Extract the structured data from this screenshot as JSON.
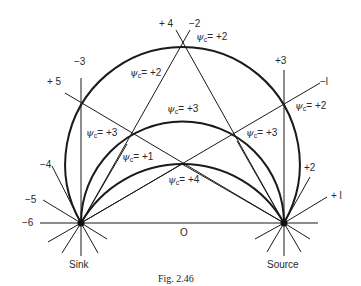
{
  "figure": {
    "caption": "Fig. 2.46",
    "sink_label": "Sink",
    "source_label": "Source",
    "axis_zero_label": "O"
  },
  "line_labels": {
    "minus6": "−6",
    "minus5": "−5",
    "minus4": "−4",
    "minus3": "−3",
    "plus5": "+ 5",
    "plus4": "+ 4",
    "minus2": "−2",
    "plus3": "+3",
    "minus1": "−l",
    "plus2": "+2",
    "plus1": "+ l"
  },
  "region_labels": [
    {
      "symbol": "ψ",
      "sub": "c",
      "value": "= +2"
    },
    {
      "symbol": "ψ",
      "sub": "c",
      "value": "= +2"
    },
    {
      "symbol": "ψ",
      "sub": "c",
      "value": "= +2"
    },
    {
      "symbol": "ψ",
      "sub": "c",
      "value": "= +3"
    },
    {
      "symbol": "ψ",
      "sub": "c",
      "value": "= +3"
    },
    {
      "symbol": "ψ",
      "sub": "c",
      "value": "= +3"
    },
    {
      "symbol": "ψ",
      "sub": "c",
      "value": "= +1"
    },
    {
      "symbol": "ψ",
      "sub": "c",
      "value": "= +4"
    }
  ],
  "colors": {
    "ink": "#1a1a1a",
    "background": "#ffffff"
  }
}
